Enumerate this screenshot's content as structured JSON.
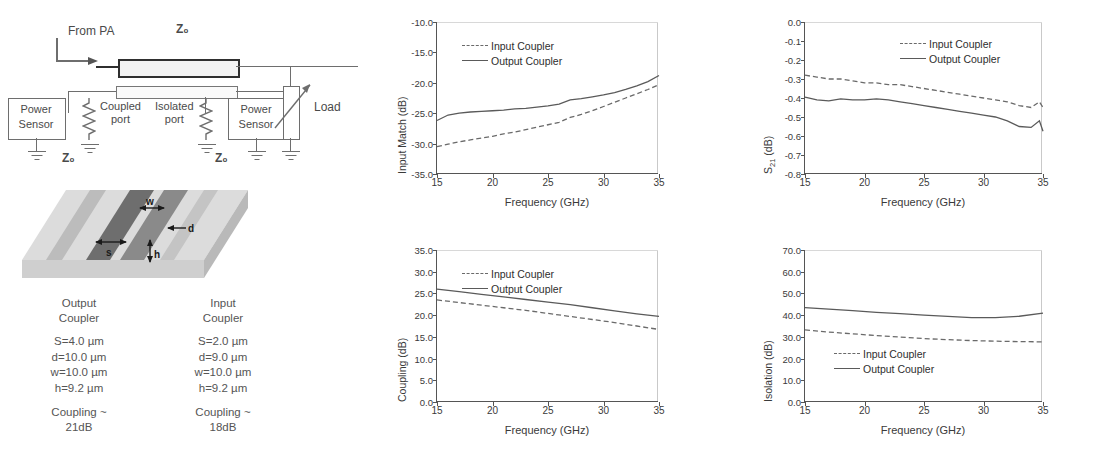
{
  "schematic": {
    "labels": {
      "from_pa": "From PA",
      "z0_top": "Z₀",
      "coupled_port": "Coupled\nport",
      "isolated_port": "Isolated\nport",
      "power_sensor_left": "Power\nSensor",
      "power_sensor_right": "Power\nSensor",
      "z0_left": "Z₀",
      "z0_right": "Z₀",
      "load": "Load"
    }
  },
  "coupler3d": {
    "dimension_labels": {
      "w": "w",
      "d": "d",
      "s": "s",
      "h": "h"
    }
  },
  "parameters": {
    "columns": [
      {
        "title_line1": "Output",
        "title_line2": "Coupler",
        "values": [
          "S=4.0 µm",
          "d=10.0 µm",
          "w=10.0 µm",
          "h=9.2 µm"
        ],
        "coupling_line1": "Coupling ~",
        "coupling_line2": "21dB"
      },
      {
        "title_line1": "Input",
        "title_line2": "Coupler",
        "values": [
          "S=2.0 µm",
          "d=9.0 µm",
          "w=10.0 µm",
          "h=9.2 µm"
        ],
        "coupling_line1": "Coupling ~",
        "coupling_line2": "18dB"
      }
    ]
  },
  "legend_labels": {
    "input": "Input Coupler",
    "output": "Output Coupler"
  },
  "chart_data": [
    {
      "id": "input-match",
      "type": "line",
      "title": "",
      "xlabel": "Frequency (GHz)",
      "ylabel": "Input Match (dB)",
      "xlim": [
        15,
        35
      ],
      "ylim": [
        -35.0,
        -10.0
      ],
      "xticks": [
        15,
        20,
        25,
        30,
        35
      ],
      "yticks": [
        -35.0,
        -30.0,
        -25.0,
        -20.0,
        -15.0,
        -10.0
      ],
      "ytick_labels": [
        "-35.0",
        "-30.0",
        "-25.0",
        "-20.0",
        "-15.0",
        "-10.0"
      ],
      "xtick_labels": [
        "15",
        "20",
        "25",
        "30",
        "35"
      ],
      "grid": false,
      "legend_position": "top-left",
      "x": [
        15,
        16,
        17,
        18,
        19,
        20,
        21,
        22,
        23,
        24,
        25,
        26,
        27,
        28,
        29,
        30,
        31,
        32,
        33,
        34,
        35
      ],
      "series": [
        {
          "name": "Input Coupler",
          "style": "dashed",
          "values": [
            -30.5,
            -30.1,
            -29.7,
            -29.4,
            -29.1,
            -28.8,
            -28.4,
            -28.1,
            -27.7,
            -27.3,
            -26.9,
            -26.5,
            -25.7,
            -25.2,
            -24.6,
            -23.9,
            -23.2,
            -22.5,
            -21.8,
            -21.1,
            -20.3
          ]
        },
        {
          "name": "Output Coupler",
          "style": "solid",
          "values": [
            -26.2,
            -25.3,
            -25.0,
            -24.8,
            -24.7,
            -24.6,
            -24.5,
            -24.3,
            -24.2,
            -24.0,
            -23.8,
            -23.5,
            -22.8,
            -22.6,
            -22.3,
            -22.0,
            -21.6,
            -21.1,
            -20.5,
            -19.8,
            -18.8
          ]
        }
      ]
    },
    {
      "id": "s21",
      "type": "line",
      "title": "",
      "xlabel": "Frequency (GHz)",
      "ylabel": "S21 (dB)",
      "xlim": [
        15,
        35
      ],
      "ylim": [
        -0.8,
        0.0
      ],
      "xticks": [
        15,
        20,
        25,
        30,
        35
      ],
      "yticks": [
        -0.8,
        -0.7,
        -0.6,
        -0.5,
        -0.4,
        -0.3,
        -0.2,
        -0.1,
        0.0
      ],
      "ytick_labels": [
        "-0.8",
        "-0.7",
        "-0.6",
        "-0.5",
        "-0.4",
        "-0.3",
        "-0.2",
        "-0.1",
        "0.0"
      ],
      "xtick_labels": [
        "15",
        "20",
        "25",
        "30",
        "35"
      ],
      "grid": false,
      "legend_position": "top-right",
      "x": [
        15,
        16,
        17,
        18,
        19,
        20,
        21,
        22,
        23,
        24,
        25,
        26,
        27,
        28,
        29,
        30,
        31,
        32,
        33,
        34,
        34.7,
        35
      ],
      "series": [
        {
          "name": "Input Coupler",
          "style": "dashed",
          "values": [
            -0.28,
            -0.29,
            -0.3,
            -0.3,
            -0.31,
            -0.32,
            -0.32,
            -0.33,
            -0.33,
            -0.34,
            -0.35,
            -0.36,
            -0.37,
            -0.38,
            -0.39,
            -0.4,
            -0.41,
            -0.42,
            -0.44,
            -0.45,
            -0.42,
            -0.45
          ]
        },
        {
          "name": "Output Coupler",
          "style": "solid",
          "values": [
            -0.395,
            -0.41,
            -0.415,
            -0.405,
            -0.41,
            -0.41,
            -0.405,
            -0.41,
            -0.42,
            -0.43,
            -0.44,
            -0.45,
            -0.46,
            -0.47,
            -0.48,
            -0.49,
            -0.5,
            -0.52,
            -0.55,
            -0.555,
            -0.52,
            -0.575
          ]
        }
      ]
    },
    {
      "id": "coupling",
      "type": "line",
      "title": "",
      "xlabel": "Frequency (GHz)",
      "ylabel": "Coupling (dB)",
      "xlim": [
        15,
        35
      ],
      "ylim": [
        0.0,
        35.0
      ],
      "xticks": [
        15,
        20,
        25,
        30,
        35
      ],
      "yticks": [
        0.0,
        5.0,
        10.0,
        15.0,
        20.0,
        25.0,
        30.0,
        35.0
      ],
      "ytick_labels": [
        "0.0",
        "5.0",
        "10.0",
        "15.0",
        "20.0",
        "25.0",
        "30.0",
        "35.0"
      ],
      "xtick_labels": [
        "15",
        "20",
        "25",
        "30",
        "35"
      ],
      "grid": false,
      "legend_position": "top-left",
      "x": [
        15,
        17,
        19,
        21,
        23,
        25,
        27,
        29,
        31,
        33,
        35
      ],
      "series": [
        {
          "name": "Input Coupler",
          "style": "dashed",
          "values": [
            23.5,
            22.9,
            22.3,
            21.7,
            21.1,
            20.4,
            19.7,
            19.0,
            18.3,
            17.5,
            16.7
          ]
        },
        {
          "name": "Output Coupler",
          "style": "solid",
          "values": [
            26.0,
            25.4,
            24.8,
            24.2,
            23.6,
            23.0,
            22.4,
            21.7,
            21.0,
            20.3,
            19.7
          ]
        }
      ]
    },
    {
      "id": "isolation",
      "type": "line",
      "title": "",
      "xlabel": "Frequency (GHz)",
      "ylabel": "Isolation (dB)",
      "xlim": [
        15,
        35
      ],
      "ylim": [
        0.0,
        70.0
      ],
      "xticks": [
        15,
        20,
        25,
        30,
        35
      ],
      "yticks": [
        0.0,
        10.0,
        20.0,
        30.0,
        40.0,
        50.0,
        60.0,
        70.0
      ],
      "ytick_labels": [
        "0.0",
        "10.0",
        "20.0",
        "30.0",
        "40.0",
        "50.0",
        "60.0",
        "70.0"
      ],
      "xtick_labels": [
        "15",
        "20",
        "25",
        "30",
        "35"
      ],
      "grid": false,
      "legend_position": "bottom-left",
      "x": [
        15,
        17,
        19,
        21,
        23,
        25,
        27,
        29,
        31,
        33,
        35
      ],
      "series": [
        {
          "name": "Input Coupler",
          "style": "dashed",
          "values": [
            33.2,
            32.2,
            31.4,
            30.6,
            29.9,
            29.2,
            28.7,
            28.3,
            28.0,
            27.8,
            27.7
          ]
        },
        {
          "name": "Output Coupler",
          "style": "solid",
          "values": [
            43.5,
            42.8,
            42.1,
            41.3,
            40.7,
            40.0,
            39.4,
            38.9,
            38.9,
            39.5,
            40.9
          ]
        }
      ]
    }
  ]
}
